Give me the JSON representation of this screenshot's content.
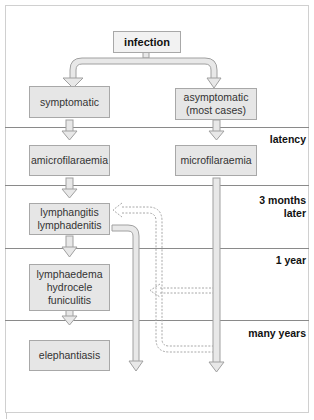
{
  "diagram": {
    "top": "infection",
    "branches": {
      "left": "symptomatic",
      "right": "asymptomatic\n(most cases)"
    },
    "nodes": {
      "amicrofilaraemia": "amicrofilaraemia",
      "microfilaraemia": "microfilaraemia",
      "lymphangitis": "lymphangitis\nlymphadenitis",
      "lymphaedema": "lymphaedema\nhydrocele\nfuniculitis",
      "elephantiasis": "elephantiasis"
    },
    "time_labels": [
      {
        "label": "latency"
      },
      {
        "label": "3 months\nlater"
      },
      {
        "label": "1 year"
      },
      {
        "label": "many years"
      }
    ],
    "colors": {
      "box_fill": "#e6e6e6",
      "box_border": "#a8a8a8",
      "arrow_fill": "#e8e8e8",
      "arrow_stroke": "#a0a0a0",
      "divider": "#8a8a8a"
    }
  }
}
